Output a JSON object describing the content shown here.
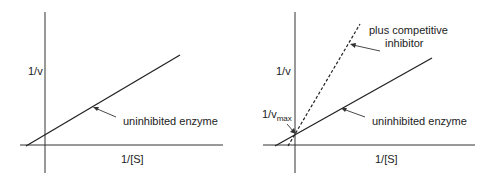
{
  "left_panel": {
    "y_axis_label": "1/v",
    "x_axis_label": "1/[S]",
    "line_label": "uninhibited enzyme"
  },
  "right_panel": {
    "y_axis_label": "1/v",
    "x_axis_label": "1/[S]",
    "intercept_label": "1/v",
    "intercept_sub": "max",
    "line_label": "uninhibited enzyme",
    "inhibitor_label_1": "plus competitive",
    "inhibitor_label_2": "inhibitor"
  },
  "colors": {
    "line": "#222222",
    "background": "#ffffff"
  }
}
